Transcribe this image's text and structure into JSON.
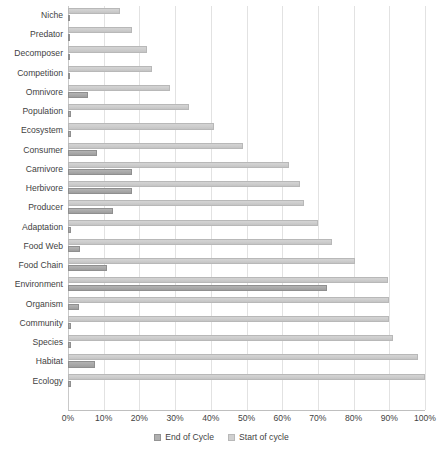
{
  "chart_data": {
    "type": "bar",
    "orientation": "horizontal",
    "title": "",
    "subtitle": "",
    "xlabel": "",
    "ylabel": "",
    "xlim": [
      0,
      100
    ],
    "xtick_labels": [
      "0%",
      "10%",
      "20%",
      "30%",
      "40%",
      "50%",
      "60%",
      "70%",
      "80%",
      "90%",
      "100%"
    ],
    "xtick_values": [
      0,
      10,
      20,
      30,
      40,
      50,
      60,
      70,
      80,
      90,
      100
    ],
    "grid": true,
    "grid_axis": "x",
    "legend_position": "bottom",
    "categories": [
      "Niche",
      "Predator",
      "Decomposer",
      "Competition",
      "Omnivore",
      "Population",
      "Ecosystem",
      "Consumer",
      "Carnivore",
      "Herbivore",
      "Producer",
      "Adaptation",
      "Food Web",
      "Food Chain",
      "Environment",
      "Organism",
      "Community",
      "Species",
      "Habitat",
      "Ecology"
    ],
    "series": [
      {
        "name": "End of Cycle",
        "color": "#ababab",
        "values": [
          0.5,
          0.5,
          0.5,
          0.5,
          5.5,
          0.8,
          0.8,
          8.0,
          18.0,
          18.0,
          12.5,
          0.8,
          3.5,
          11.0,
          72.5,
          3.0,
          0.8,
          0.8,
          7.5,
          0.8
        ]
      },
      {
        "name": "Start of cycle",
        "color": "#cfcfcf",
        "values": [
          14.6,
          18.0,
          22.0,
          23.5,
          28.5,
          34.0,
          41.0,
          49.0,
          62.0,
          65.0,
          66.0,
          70.0,
          74.0,
          80.5,
          89.5,
          90.0,
          90.0,
          91.0,
          98.0,
          100.0
        ]
      }
    ]
  },
  "legend": {
    "items": [
      {
        "label": "End of Cycle",
        "swatch_class": "sw-end"
      },
      {
        "label": "Start of cycle",
        "swatch_class": "sw-start"
      }
    ]
  }
}
